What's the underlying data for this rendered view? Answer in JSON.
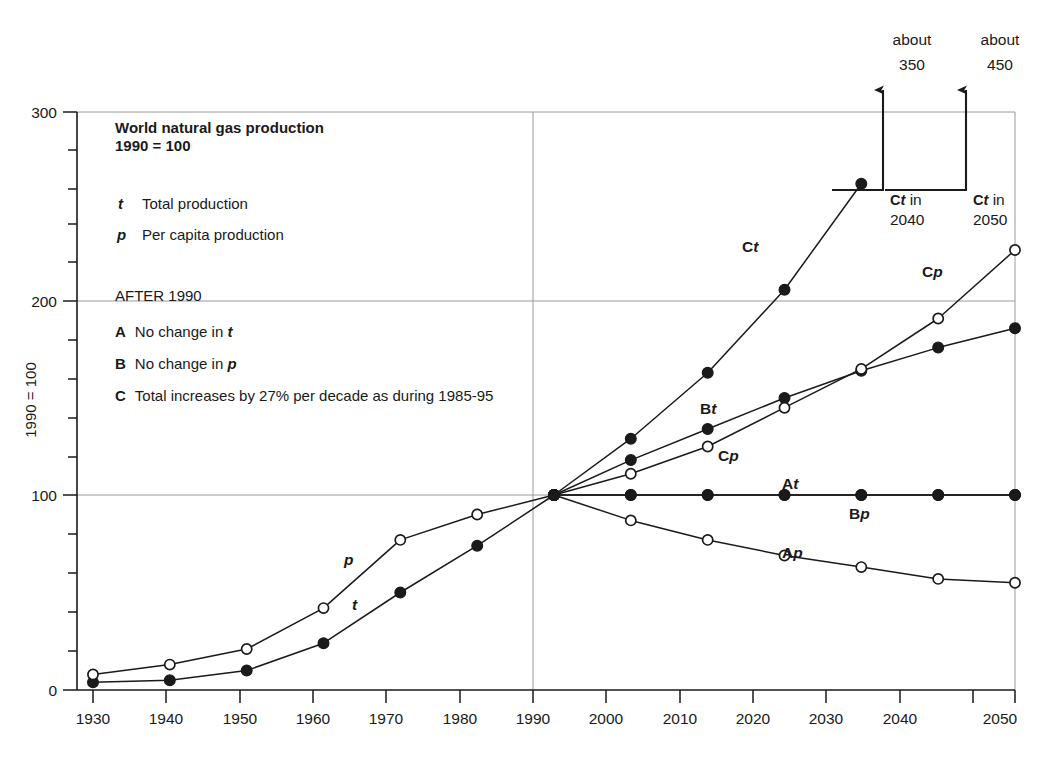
{
  "chart_data": {
    "type": "line",
    "title": "World natural gas production",
    "subtitle": "1990 = 100",
    "ylabel": "1990 = 100",
    "xlabel": "",
    "ylim": [
      0,
      300
    ],
    "yticks": [
      0,
      100,
      200,
      300
    ],
    "yticklabels": [
      "0",
      "100",
      "200",
      "300"
    ],
    "minor_tick_step": 20,
    "grid": "horizontal gridlines at 100,200,300 plus vertical gridlines at 1990 and 2050",
    "xlim": [
      1930,
      2050
    ],
    "x": [
      1930,
      1940,
      1950,
      1960,
      1970,
      1980,
      1990,
      2000,
      2010,
      2020,
      2030,
      2040,
      2050
    ],
    "xticklabels": [
      "1930",
      "1940",
      "1950",
      "1960",
      "1970",
      "1980",
      "1990",
      "2000",
      "2010",
      "2020",
      "2030",
      "2040",
      "2050"
    ],
    "legend_position": "upper-left inside plot",
    "series": [
      {
        "name": "t",
        "label": "t",
        "marker": "filled-circle",
        "x": [
          1930,
          1940,
          1950,
          1960,
          1970,
          1980,
          1990
        ],
        "values": [
          4,
          5,
          10,
          24,
          50,
          74,
          100
        ]
      },
      {
        "name": "p",
        "label": "p",
        "marker": "open-circle",
        "x": [
          1930,
          1940,
          1950,
          1960,
          1970,
          1980,
          1990
        ],
        "values": [
          8,
          13,
          21,
          42,
          77,
          90,
          100
        ]
      },
      {
        "name": "At",
        "label": "At",
        "marker": "filled-circle",
        "x": [
          1990,
          2000,
          2010,
          2020,
          2030,
          2040,
          2050
        ],
        "values": [
          100,
          100,
          100,
          100,
          100,
          100,
          100
        ]
      },
      {
        "name": "Bp",
        "label": "Bp",
        "marker": "filled-circle",
        "x": [
          1990,
          2000,
          2010,
          2020,
          2030,
          2040,
          2050
        ],
        "values": [
          100,
          100,
          100,
          100,
          100,
          100,
          100
        ]
      },
      {
        "name": "Ap",
        "label": "Ap",
        "marker": "open-circle",
        "x": [
          1990,
          2000,
          2010,
          2020,
          2030,
          2040,
          2050
        ],
        "values": [
          100,
          87,
          77,
          69,
          63,
          57,
          55
        ]
      },
      {
        "name": "Bt",
        "label": "Bt",
        "marker": "filled-circle",
        "x": [
          1990,
          2000,
          2010,
          2020,
          2030,
          2040,
          2050
        ],
        "values": [
          100,
          118,
          134,
          150,
          164,
          176,
          186
        ]
      },
      {
        "name": "Cp",
        "label": "Cp",
        "marker": "open-circle",
        "x": [
          1990,
          2000,
          2010,
          2020,
          2030,
          2040,
          2050
        ],
        "values": [
          100,
          111,
          125,
          145,
          165,
          191,
          227
        ]
      },
      {
        "name": "Ct",
        "label": "Ct",
        "marker": "filled-circle",
        "x": [
          1990,
          2000,
          2010,
          2020,
          2030
        ],
        "values": [
          100,
          129,
          163,
          206,
          262
        ]
      }
    ],
    "annotations": [
      {
        "name": "ct-2040",
        "caption_top": "about",
        "value_top": "350",
        "caption_bottom_bold": "Ct",
        "caption_bottom_rest": " in",
        "caption_bottom_line2": "2040"
      },
      {
        "name": "ct-2050",
        "caption_top": "about",
        "value_top": "450",
        "caption_bottom_bold": "Ct",
        "caption_bottom_rest": " in",
        "caption_bottom_line2": "2050"
      }
    ]
  },
  "legend": {
    "title_line1": "World natural gas production",
    "title_line2": "1990 = 100",
    "keys": [
      {
        "symbol": "t",
        "text": "Total production"
      },
      {
        "symbol": "p",
        "text": "Per capita production"
      }
    ],
    "after_header": "AFTER 1990",
    "scenarios": [
      {
        "letter": "A",
        "pre": "No change in ",
        "sym": "t",
        "post": ""
      },
      {
        "letter": "B",
        "pre": "No change in ",
        "sym": "p",
        "post": ""
      },
      {
        "letter": "C",
        "pre": "Total increases by 27% per decade as during 1985-95",
        "sym": "",
        "post": ""
      }
    ]
  },
  "curve_labels": {
    "p": "p",
    "t": "t",
    "Ct_bold": "C",
    "Ct_it": "t",
    "Cp_bold": "C",
    "Cp_it": "p",
    "Bt_bold": "B",
    "Bt_it": "t",
    "At_bold": "A",
    "At_it": "t",
    "Bp_bold": "B",
    "Bp_it": "p",
    "Ap_bold": "A",
    "Ap_it": "p",
    "Cp2_bold": "C",
    "Cp2_it": "p"
  },
  "arrow_annotations": {
    "left": {
      "word": "about",
      "number": "350",
      "cap_bold": "C",
      "cap_it": "t",
      "cap_rest": " in",
      "cap_year": "2040"
    },
    "right": {
      "word": "about",
      "number": "450",
      "cap_bold": "C",
      "cap_it": "t",
      "cap_rest": " in",
      "cap_year": "2050"
    }
  },
  "axis": {
    "y_title": "1990 = 100",
    "y_labels": [
      "300",
      "200",
      "100",
      "0"
    ],
    "x_labels": [
      "1930",
      "1940",
      "1950",
      "1960",
      "1970",
      "1980",
      "1990",
      "2000",
      "2010",
      "2020",
      "2030",
      "2040",
      "2050"
    ]
  },
  "colors": {
    "ink": "#1a1a1a",
    "grid": "#9a9a9a",
    "background": "#ffffff"
  }
}
